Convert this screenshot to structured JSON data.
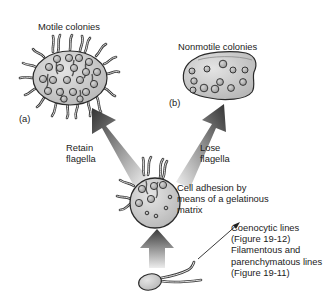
{
  "diagram": {
    "labels": {
      "motile_title": "Motile colonies",
      "motile_letter": "(a)",
      "nonmotile_title": "Nonmotile colonies",
      "nonmotile_letter": "(b)",
      "retain": [
        "Retain",
        "flagella"
      ],
      "lose": [
        "Lose",
        "flagella"
      ],
      "adhesion": [
        "Cell adhesion by",
        "means of a gelatinous",
        "matrix"
      ],
      "lines": [
        "Coenocytic lines",
        "(Figure 19-12)",
        "Filamentous and",
        "parenchymatous lines",
        "(Figure 19-11)"
      ]
    },
    "nodes": [
      {
        "id": "motile-colony",
        "label": "Motile colonies",
        "letter": "(a)"
      },
      {
        "id": "nonmotile-colony",
        "label": "Nonmotile colonies",
        "letter": "(b)"
      },
      {
        "id": "gelatinous-aggregate",
        "label": "Cell adhesion by means of a gelatinous matrix"
      },
      {
        "id": "single-flagellate",
        "label": "Unicellular flagellate"
      }
    ],
    "edges": [
      {
        "from": "single-flagellate",
        "to": "gelatinous-aggregate",
        "label": ""
      },
      {
        "from": "gelatinous-aggregate",
        "to": "motile-colony",
        "label": "Retain flagella"
      },
      {
        "from": "gelatinous-aggregate",
        "to": "nonmotile-colony",
        "label": "Lose flagella"
      },
      {
        "from": "single-flagellate",
        "to": "other-lines",
        "label": "Coenocytic lines (Figure 19-12); Filamentous and parenchymatous lines (Figure 19-11)"
      }
    ],
    "colors": {
      "cell_fill": "#c9c9c9",
      "colony_fill": "#d0d0d0",
      "outline": "#2a2a2a",
      "arrow_dark": "#3a3a3a",
      "arrow_light": "#e6e6e6"
    }
  }
}
